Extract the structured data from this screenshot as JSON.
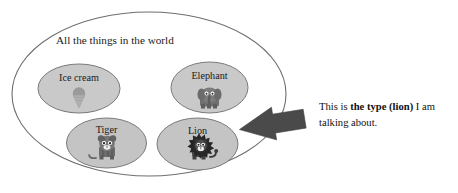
{
  "diagram": {
    "type": "venn-set-diagram",
    "universe": {
      "label": "All the things in the world",
      "icon_name": "universe-ellipse",
      "stroke_color": "#6e6e6e",
      "fill_color": "#ffffff"
    },
    "sets": [
      {
        "id": "ice-cream",
        "label": "Ice cream",
        "icon_name": "ice-cream-cone-icon",
        "fill_color": "#c9c9c9",
        "stroke_color": "#7a7a7a",
        "highlighted": false
      },
      {
        "id": "elephant",
        "label": "Elephant",
        "icon_name": "elephant-icon",
        "fill_color": "#c9c9c9",
        "stroke_color": "#7a7a7a",
        "highlighted": false
      },
      {
        "id": "tiger",
        "label": "Tiger",
        "icon_name": "tiger-icon",
        "fill_color": "#c4c4c4",
        "stroke_color": "#7a7a7a",
        "highlighted": false
      },
      {
        "id": "lion",
        "label": "Lion",
        "icon_name": "lion-icon",
        "fill_color": "#c4c4c4",
        "stroke_color": "#7a7a7a",
        "highlighted": true
      }
    ],
    "pointer": {
      "icon_name": "left-arrow-icon",
      "color": "#4a4a4a",
      "points_to": "lion"
    }
  },
  "annotation": {
    "line1_prefix": "This is ",
    "emphasis": "the type (lion)",
    "line1_suffix": " I am",
    "line2": "talking about."
  }
}
